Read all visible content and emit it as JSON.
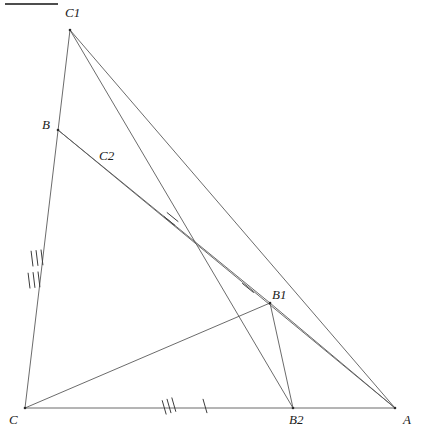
{
  "figure": {
    "width": 421,
    "height": 438,
    "background_color": "#ffffff",
    "line_color": "#5a5a5a",
    "label_color": "#1a1a1a"
  },
  "points": [
    {
      "name": "C",
      "label": "C",
      "x": 25,
      "y": 408,
      "label_x": 9,
      "label_y": 413
    },
    {
      "name": "A",
      "label": "A",
      "x": 395,
      "y": 408,
      "label_x": 403,
      "label_y": 413
    },
    {
      "name": "B",
      "label": "B",
      "x": 58,
      "y": 130,
      "label_x": 42,
      "label_y": 118
    },
    {
      "name": "C1",
      "label": "C1",
      "x": 70,
      "y": 30,
      "label_x": 65,
      "label_y": 6
    },
    {
      "name": "C2",
      "label": "C2",
      "x": 104,
      "y": 172,
      "label_x": 99,
      "label_y": 149
    },
    {
      "name": "B1",
      "label": "B1",
      "x": 270,
      "y": 303,
      "label_x": 272,
      "label_y": 288
    },
    {
      "name": "B2",
      "label": "B2",
      "x": 293,
      "y": 408,
      "label_x": 289,
      "label_y": 413
    }
  ],
  "segments": [
    {
      "name": "C-A",
      "from": "C",
      "to": "A",
      "x1": 25,
      "y1": 408,
      "x2": 395,
      "y2": 408
    },
    {
      "name": "C-C1",
      "from": "C",
      "to": "C1",
      "x1": 25,
      "y1": 408,
      "x2": 70,
      "y2": 30
    },
    {
      "name": "C1-A",
      "from": "C1",
      "to": "A",
      "x1": 70,
      "y1": 30,
      "x2": 395,
      "y2": 408
    },
    {
      "name": "C1-B2",
      "from": "C1",
      "to": "B2",
      "x1": 70,
      "y1": 30,
      "x2": 293,
      "y2": 408
    },
    {
      "name": "B-A",
      "from": "B",
      "to": "A",
      "x1": 58,
      "y1": 130,
      "x2": 395,
      "y2": 408
    },
    {
      "name": "B-B1",
      "from": "B",
      "to": "B1",
      "x1": 58,
      "y1": 130,
      "x2": 270,
      "y2": 303
    },
    {
      "name": "C-B1",
      "from": "C",
      "to": "B1",
      "x1": 25,
      "y1": 408,
      "x2": 270,
      "y2": 303
    },
    {
      "name": "B1-B2",
      "from": "B1",
      "to": "B2",
      "x1": 270,
      "y1": 303,
      "x2": 293,
      "y2": 408
    },
    {
      "name": "B1-A",
      "from": "B1",
      "to": "A",
      "x1": 270,
      "y1": 303,
      "x2": 395,
      "y2": 408
    }
  ],
  "tick_marks": [
    {
      "name": "tick-CB-triple-upper",
      "on_segment": "C-C1",
      "count": 3,
      "cx": 37,
      "cy": 258,
      "angle": 83,
      "length": 15,
      "spacing": 5
    },
    {
      "name": "tick-CB-triple-lower",
      "on_segment": "C-C1",
      "count": 3,
      "cx": 34,
      "cy": 280,
      "angle": 83,
      "length": 15,
      "spacing": 5
    },
    {
      "name": "tick-BC2-double",
      "on_segment": "B-A",
      "count": 2,
      "cx": 171,
      "cy": 219,
      "angle": 39,
      "length": 14,
      "spacing": 5
    },
    {
      "name": "tick-B1-single",
      "on_segment": "B-A",
      "count": 1,
      "cx": 248,
      "cy": 288,
      "angle": 39,
      "length": 14,
      "spacing": 0
    },
    {
      "name": "tick-CB2-triple",
      "on_segment": "C-A",
      "count": 3,
      "cx": 169,
      "cy": 406,
      "angle": 74,
      "length": 14,
      "spacing": 5
    },
    {
      "name": "tick-CB2-single",
      "on_segment": "C-A",
      "count": 1,
      "cx": 205,
      "cy": 406,
      "angle": 74,
      "length": 14,
      "spacing": 0
    }
  ],
  "corner_rule": {
    "name": "top-left-rule",
    "x1": 5,
    "y1": 4,
    "x2": 58,
    "y2": 4
  }
}
